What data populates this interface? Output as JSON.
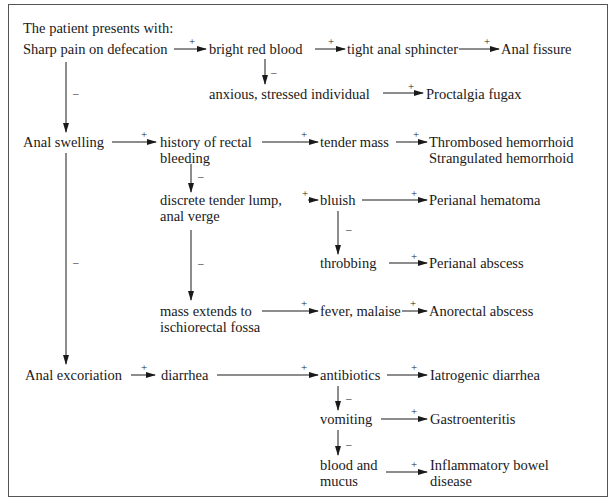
{
  "title": "The patient presents with:",
  "nodes": {
    "sharp_pain": "Sharp pain on defecation",
    "bright_red_blood": "bright red blood",
    "tight_sphincter": "tight anal sphincter",
    "anal_fissure": "Anal fissure",
    "anxious": "anxious, stressed individual",
    "proctalgia": "Proctalgia fugax",
    "anal_swelling": "Anal swelling",
    "history_rectal_1": "history of rectal",
    "history_rectal_2": "bleeding",
    "tender_mass": "tender mass",
    "thrombosed": "Thrombosed hemorrhoid",
    "strangulated": "Strangulated hemorrhoid",
    "discrete_lump_1": "discrete tender lump,",
    "discrete_lump_2": "anal verge",
    "bluish": "bluish",
    "perianal_hematoma": "Perianal hematoma",
    "throbbing": "throbbing",
    "perianal_abscess": "Perianal abscess",
    "mass_extends_1": "mass extends to",
    "mass_extends_2": "ischiorectal fossa",
    "fever": "fever, malaise",
    "anorectal_abscess": "Anorectal abscess",
    "anal_excoriation": "Anal excoriation",
    "diarrhea": "diarrhea",
    "antibiotics": "antibiotics",
    "iatrogenic": "Iatrogenic diarrhea",
    "vomiting": "vomiting",
    "gastroenteritis": "Gastroenteritis",
    "blood_mucus_1": "blood and",
    "blood_mucus_2": "mucus",
    "ibd_1": "Inflammatory bowel",
    "ibd_2": "disease"
  },
  "signs": {
    "plus": "+",
    "minus": "–"
  },
  "edges": [
    {
      "from": "Sharp pain on defecation",
      "to": "bright red blood",
      "sign": "+"
    },
    {
      "from": "bright red blood",
      "to": "tight anal sphincter",
      "sign": "+"
    },
    {
      "from": "tight anal sphincter",
      "to": "Anal fissure",
      "sign": "+"
    },
    {
      "from": "bright red blood",
      "to": "anxious, stressed individual",
      "sign": "-"
    },
    {
      "from": "anxious, stressed individual",
      "to": "Proctalgia fugax",
      "sign": "+"
    },
    {
      "from": "Sharp pain on defecation",
      "to": "Anal swelling",
      "sign": "-"
    },
    {
      "from": "Anal swelling",
      "to": "history of rectal bleeding",
      "sign": "+"
    },
    {
      "from": "history of rectal bleeding",
      "to": "tender mass",
      "sign": "+"
    },
    {
      "from": "tender mass",
      "to": "Thrombosed hemorrhoid / Strangulated hemorrhoid",
      "sign": "+"
    },
    {
      "from": "history of rectal bleeding",
      "to": "discrete tender lump, anal verge",
      "sign": "-"
    },
    {
      "from": "discrete tender lump, anal verge",
      "to": "bluish",
      "sign": "+"
    },
    {
      "from": "bluish",
      "to": "Perianal hematoma",
      "sign": "+"
    },
    {
      "from": "bluish",
      "to": "throbbing",
      "sign": "-"
    },
    {
      "from": "throbbing",
      "to": "Perianal abscess",
      "sign": "+"
    },
    {
      "from": "discrete tender lump, anal verge",
      "to": "mass extends to ischiorectal fossa",
      "sign": "-"
    },
    {
      "from": "mass extends to ischiorectal fossa",
      "to": "fever, malaise",
      "sign": "+"
    },
    {
      "from": "fever, malaise",
      "to": "Anorectal abscess",
      "sign": "+"
    },
    {
      "from": "Anal swelling",
      "to": "Anal excoriation",
      "sign": "-"
    },
    {
      "from": "Anal excoriation",
      "to": "diarrhea",
      "sign": "+"
    },
    {
      "from": "diarrhea",
      "to": "antibiotics",
      "sign": "+"
    },
    {
      "from": "antibiotics",
      "to": "Iatrogenic diarrhea",
      "sign": "+"
    },
    {
      "from": "antibiotics",
      "to": "vomiting",
      "sign": "-"
    },
    {
      "from": "vomiting",
      "to": "Gastroenteritis",
      "sign": "+"
    },
    {
      "from": "vomiting",
      "to": "blood and mucus",
      "sign": "-"
    },
    {
      "from": "blood and mucus",
      "to": "Inflammatory bowel disease",
      "sign": "+"
    }
  ]
}
